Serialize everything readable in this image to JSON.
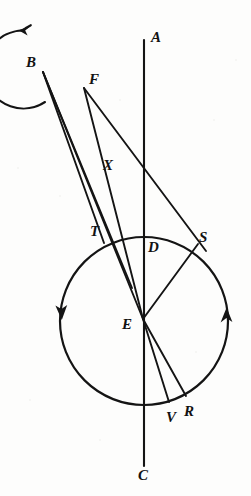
{
  "figure": {
    "background_color": "#fdfdfc",
    "stroke_color": "#141414",
    "labels": [
      {
        "id": "A",
        "text": "A",
        "x": 151,
        "y": 30
      },
      {
        "id": "B",
        "text": "B",
        "x": 26,
        "y": 55
      },
      {
        "id": "F",
        "text": "F",
        "x": 89,
        "y": 72
      },
      {
        "id": "X",
        "text": "X",
        "x": 103,
        "y": 158
      },
      {
        "id": "T",
        "text": "T",
        "x": 90,
        "y": 224
      },
      {
        "id": "D",
        "text": "D",
        "x": 148,
        "y": 240
      },
      {
        "id": "S",
        "text": "S",
        "x": 199,
        "y": 230
      },
      {
        "id": "E",
        "text": "E",
        "x": 122,
        "y": 317
      },
      {
        "id": "V",
        "text": "V",
        "x": 166,
        "y": 410
      },
      {
        "id": "R",
        "text": "R",
        "x": 184,
        "y": 404
      },
      {
        "id": "C",
        "text": "C",
        "x": 138,
        "y": 468
      }
    ],
    "points": {
      "A_line_top": {
        "x": 144,
        "y": 40
      },
      "C_line_bottom": {
        "x": 144,
        "y": 466
      },
      "B_vertex": {
        "x": 43,
        "y": 72
      },
      "F_vertex": {
        "x": 84,
        "y": 88
      },
      "E_center": {
        "x": 143,
        "y": 319
      },
      "T_point": {
        "x": 104,
        "y": 243
      },
      "D_point": {
        "x": 144,
        "y": 253
      },
      "S_point": {
        "x": 198,
        "y": 244
      },
      "V_point": {
        "x": 169,
        "y": 402
      },
      "R_point": {
        "x": 186,
        "y": 396
      }
    },
    "circles": [
      {
        "id": "small-circle",
        "name": "circle-at-B",
        "cx": 45,
        "cy": 63,
        "r": 39,
        "arrow_direction": "counterclockwise",
        "arrow_position": "top-left"
      },
      {
        "id": "large-circle",
        "name": "circle-at-E",
        "cx": 144,
        "cy": 321,
        "r": 84,
        "arrow_direction": "counterclockwise",
        "arrow_position": "left-and-right"
      }
    ],
    "axis_line": {
      "from": "A",
      "to": "C",
      "orientation": "vertical"
    },
    "rays_from_B": [
      "to-T",
      "to-D",
      "to-E"
    ],
    "rays_from_F": [
      "to-E",
      "to-S"
    ],
    "radii_from_E": [
      "to-S",
      "to-V",
      "to-R"
    ]
  }
}
